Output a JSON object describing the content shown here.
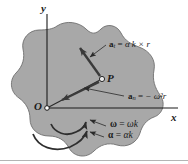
{
  "figure": {
    "background_color": "#ffffff",
    "body_fill_color": "#a8a8a8",
    "body_stroke_color": "#6e6e6e",
    "line_color": "#1a1a1a",
    "axes": {
      "y_label": "y",
      "x_label": "x",
      "origin_label": "O"
    },
    "points": [
      {
        "name": "origin",
        "label": "O",
        "x": 47,
        "y": 108
      },
      {
        "name": "point-p",
        "label": "P",
        "x": 102,
        "y": 79
      }
    ],
    "vectors": [
      {
        "name": "tangential-acceleration",
        "label_symbol": "a",
        "label_subscript": "t",
        "equals": "=",
        "expression": "α k × r",
        "label_text": "a_t = α k × r",
        "from": "P",
        "direction": "up-left"
      },
      {
        "name": "normal-acceleration",
        "label_symbol": "a",
        "label_subscript": "n",
        "equals": "=",
        "expression": "− ω²r",
        "label_text": "a_n = − ω²r",
        "from": "P",
        "direction": "toward-origin"
      }
    ],
    "rotation_labels": [
      {
        "name": "angular-velocity",
        "symbol": "ω",
        "equals": "=",
        "expression": "ωk",
        "label_text": "ω = ωk"
      },
      {
        "name": "angular-acceleration",
        "symbol": "α",
        "equals": "=",
        "expression": "αk",
        "label_text": "α = αk"
      }
    ]
  }
}
